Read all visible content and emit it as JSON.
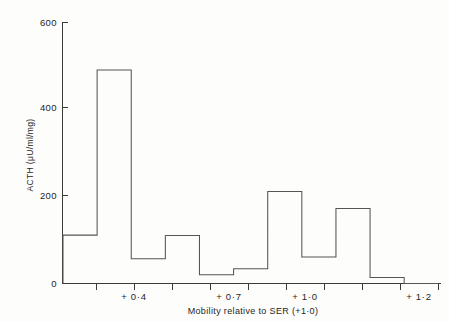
{
  "chart_data": {
    "type": "bar",
    "title": "",
    "subtitle": "",
    "xlabel": "Mobility relative to SER (+1·0)",
    "ylabel": "ACTH (μU/ml/mg)",
    "xlim": [
      0,
      11
    ],
    "ylim": [
      0,
      600
    ],
    "grid": false,
    "legend": null,
    "y_ticks": [
      {
        "value": 0,
        "label": "0"
      },
      {
        "value": 200,
        "label": "200"
      },
      {
        "value": 400,
        "label": "400"
      },
      {
        "value": 600,
        "label": "600"
      }
    ],
    "x_ticks": [
      {
        "bin_index": 0,
        "label": ""
      },
      {
        "bin_index": 1,
        "label": ""
      },
      {
        "bin_index": 2,
        "label": ""
      },
      {
        "bin_index": 3,
        "label": ""
      },
      {
        "bin_index": 4,
        "label": ""
      },
      {
        "bin_index": 5,
        "label": ""
      },
      {
        "bin_index": 6,
        "label": ""
      },
      {
        "bin_index": 7,
        "label": ""
      },
      {
        "bin_index": 8,
        "label": ""
      },
      {
        "bin_index": 9,
        "label": ""
      },
      {
        "bin_index": 10,
        "label": ""
      }
    ],
    "x_tick_labels": [
      {
        "bin_center": 1.5,
        "label": "+ 0·4"
      },
      {
        "bin_center": 4.5,
        "label": "+ 0·7"
      },
      {
        "bin_center": 6.5,
        "label": "+ 1·0"
      },
      {
        "bin_center": 9.5,
        "label": "+ 1·2"
      }
    ],
    "categories": [
      "bin-1",
      "bin-2",
      "bin-3",
      "bin-4",
      "bin-5",
      "bin-6",
      "bin-7",
      "bin-8",
      "bin-9",
      "bin-10",
      "bin-11"
    ],
    "values": [
      111,
      490,
      57,
      110,
      20,
      34,
      211,
      61,
      172,
      14,
      0
    ],
    "bar_style": "outline-step-histogram",
    "bar_fill": "none",
    "bar_stroke": "#555555",
    "axis_color": "#3a3a3a",
    "background": "#fdfdfc"
  },
  "figure": {
    "y_axis_label": "ACTH (μU/ml/mg)",
    "x_axis_label": "Mobility relative to SER (+ 1·0)"
  }
}
